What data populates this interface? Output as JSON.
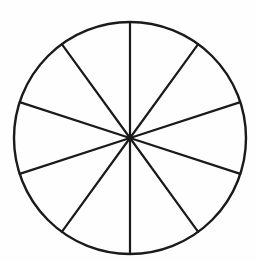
{
  "document": {
    "title": "Circle divided into ten equal sectors",
    "background_color": "#fefefe",
    "width": 256,
    "height": 261
  },
  "figure": {
    "name": "fraction-circle-tenths",
    "type": "pie-sector-diagram",
    "shape": "circle",
    "stroke_color": "#1a1a1a",
    "fill_color": "none",
    "outline_stroke_width": 2.4,
    "spoke_stroke_width": 2.2,
    "center": {
      "x": 130,
      "y": 138
    },
    "radius": 116,
    "sector_count": 10,
    "sector_angle_degrees": 36,
    "shaded_count": 0,
    "labels_visible": false,
    "spoke_angles_degrees": [
      90,
      126,
      162,
      198,
      234,
      270,
      306,
      342,
      18,
      54
    ],
    "diameter_lines": 5,
    "sectors": [
      {
        "index": 1,
        "start_angle": 90,
        "end_angle": 126,
        "shaded": false
      },
      {
        "index": 2,
        "start_angle": 126,
        "end_angle": 162,
        "shaded": false
      },
      {
        "index": 3,
        "start_angle": 162,
        "end_angle": 198,
        "shaded": false
      },
      {
        "index": 4,
        "start_angle": 198,
        "end_angle": 234,
        "shaded": false
      },
      {
        "index": 5,
        "start_angle": 234,
        "end_angle": 270,
        "shaded": false
      },
      {
        "index": 6,
        "start_angle": 270,
        "end_angle": 306,
        "shaded": false
      },
      {
        "index": 7,
        "start_angle": 306,
        "end_angle": 342,
        "shaded": false
      },
      {
        "index": 8,
        "start_angle": 342,
        "end_angle": 18,
        "shaded": false
      },
      {
        "index": 9,
        "start_angle": 18,
        "end_angle": 54,
        "shaded": false
      },
      {
        "index": 10,
        "start_angle": 54,
        "end_angle": 90,
        "shaded": false
      }
    ]
  }
}
